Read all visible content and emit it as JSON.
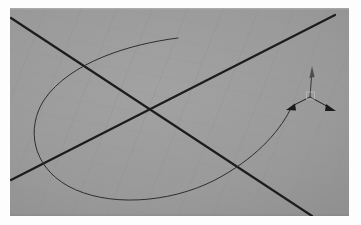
{
  "app": {
    "title": "3D Modeling Viewport",
    "view_label": "Perspective"
  },
  "viewport": {
    "name": "perspective-viewport",
    "background_color": "#9a9a9a",
    "frame_color": "#fdfdfd",
    "width": 339,
    "height": 208,
    "origin_x": 10,
    "origin_y": 8
  },
  "ground_grid": {
    "name": "construction-plane-grid",
    "line_color": "#8d8d8d",
    "line_width": 0.6,
    "opacity": 0.55,
    "direction_a_angle_deg": 31,
    "direction_b_angle_deg": -31,
    "spacing_px": 26,
    "visible": true
  },
  "axes": [
    {
      "name": "world-axis-line-1",
      "color": "#1c1c1c",
      "width": 2.2,
      "x1": 1,
      "y1": 10,
      "x2": 302,
      "y2": 208
    },
    {
      "name": "world-axis-line-2",
      "color": "#1c1c1c",
      "width": 2.2,
      "x1": 1,
      "y1": 172,
      "x2": 325,
      "y2": 7
    }
  ],
  "curve": {
    "name": "swept-u-curve",
    "color": "#2e2e2e",
    "width": 1.0,
    "path": "M 168 30 C 120 36, 60 54, 34 92 C 16 120, 22 158, 58 178 C 96 199, 158 196, 205 172 C 243 152, 268 126, 280 102",
    "start_point": {
      "x": 168,
      "y": 30
    },
    "end_point": {
      "x": 280,
      "y": 102
    }
  },
  "gizmo": {
    "name": "transform-gizmo",
    "center": {
      "x": 300,
      "y": 89
    },
    "body_color": "#3a3a3a",
    "handle_color": "#2a2a2a",
    "axes": [
      {
        "name": "gizmo-axis-z-up",
        "label": "Z",
        "color": "#2a2a2a",
        "tip": {
          "x": 302,
          "y": 62
        },
        "arrow_style": "thin-cone"
      },
      {
        "name": "gizmo-axis-x-left",
        "label": "X",
        "color": "#1e1e1e",
        "tip": {
          "x": 278,
          "y": 100
        },
        "arrow_style": "solid-cone"
      },
      {
        "name": "gizmo-axis-y-right",
        "label": "Y",
        "color": "#1e1e1e",
        "tip": {
          "x": 324,
          "y": 102
        },
        "arrow_style": "solid-cone"
      }
    ],
    "hub": {
      "name": "gizmo-origin-hub",
      "size": 8,
      "color": "#b8b8b8"
    }
  }
}
